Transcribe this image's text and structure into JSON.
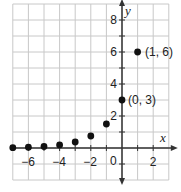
{
  "chart_data": {
    "type": "scatter",
    "title": "",
    "xlabel": "x",
    "ylabel": "y",
    "xlim": [
      -7,
      3
    ],
    "ylim": [
      -2,
      9
    ],
    "grid": true,
    "x_ticks": [
      -6,
      -4,
      -2,
      2
    ],
    "y_ticks": [
      2,
      4,
      6,
      8
    ],
    "origin_label": "0",
    "series": [
      {
        "name": "y = 3(2)^x",
        "x": [
          -7,
          -6,
          -5,
          -4,
          -3,
          -2,
          -1,
          0,
          1
        ],
        "y": [
          0.023,
          0.047,
          0.094,
          0.19,
          0.375,
          0.75,
          1.5,
          3,
          6
        ]
      }
    ],
    "annotations": [
      {
        "text": "(0, 3)",
        "x": 0,
        "y": 3
      },
      {
        "text": "(1, 6)",
        "x": 1,
        "y": 6
      }
    ]
  },
  "labels": {
    "x_axis": "x",
    "y_axis": "y",
    "origin": "0",
    "xt": [
      "−6",
      "−4",
      "−2",
      "2"
    ],
    "yt": [
      "2",
      "4",
      "6",
      "8"
    ],
    "p1": "(0, 3)",
    "p2": "(1, 6)"
  }
}
